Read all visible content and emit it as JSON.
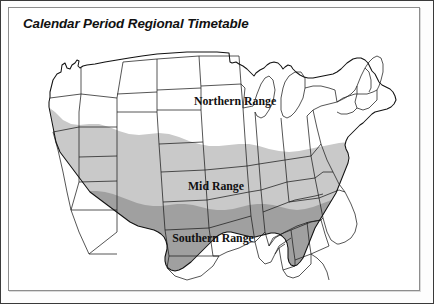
{
  "title": "Calendar Period Regional Timetable",
  "map": {
    "name": "united-states-regional-range-map",
    "labels": [
      {
        "id": "northern",
        "text": "Northern Range",
        "x": 218,
        "y": 73
      },
      {
        "id": "mid",
        "text": "Mid Range",
        "x": 199,
        "y": 158
      },
      {
        "id": "southern",
        "text": "Southern Range",
        "x": 196,
        "y": 210
      }
    ],
    "zones": [
      {
        "id": "northern",
        "label": "Northern Range",
        "fill": "#ffffff"
      },
      {
        "id": "mid",
        "label": "Mid Range",
        "fill": "#c9c9c9"
      },
      {
        "id": "southern",
        "label": "Southern Range",
        "fill": "#a0a0a0"
      }
    ],
    "colors": {
      "northern_fill": "#ffffff",
      "mid_fill": "#c9c9c9",
      "southern_fill": "#a0a0a0",
      "state_border": "#1d1d1d",
      "outline": "#111111",
      "frame_outer": "#3a3a3a",
      "frame_inner": "#8d8d8d",
      "page_background": "#ffffff",
      "title_color": "#111111"
    }
  }
}
